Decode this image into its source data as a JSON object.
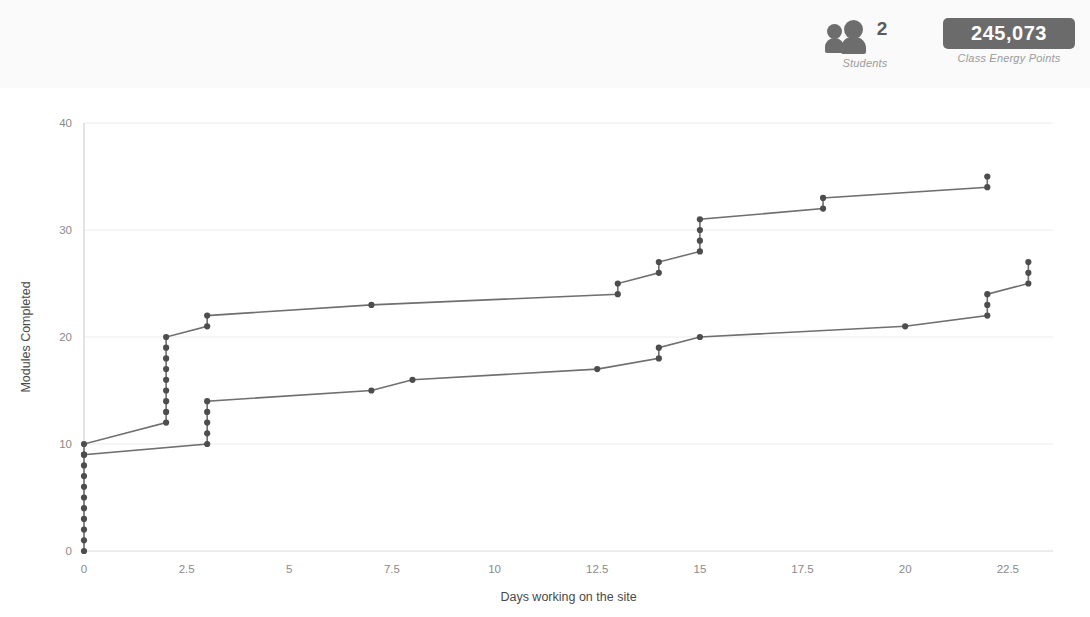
{
  "header": {
    "students": {
      "icon": "people-icon",
      "count": "2",
      "label": "Students"
    },
    "energy": {
      "value": "245,073",
      "label": "Class Energy Points"
    }
  },
  "chart_data": {
    "type": "line",
    "title": "",
    "xlabel": "Days working on the site",
    "ylabel": "Modules Completed",
    "xlim": [
      0,
      23.6
    ],
    "ylim": [
      0,
      40
    ],
    "xticks": [
      "0",
      "2.5",
      "5",
      "7.5",
      "10",
      "12.5",
      "15",
      "17.5",
      "20",
      "22.5"
    ],
    "xtick_values": [
      0,
      2.5,
      5,
      7.5,
      10,
      12.5,
      15,
      17.5,
      20,
      22.5
    ],
    "yticks": [
      "0",
      "10",
      "20",
      "30",
      "40"
    ],
    "ytick_values": [
      0,
      10,
      20,
      30,
      40
    ],
    "grid": true,
    "legend": "none",
    "marker": "circle",
    "line_color": "#6f6f6f",
    "marker_color": "#4d4d4d",
    "grid_color": "#ececec",
    "series": [
      {
        "name": "Student A",
        "points": [
          [
            0,
            9
          ],
          [
            0,
            10
          ],
          [
            2,
            12
          ],
          [
            2,
            13
          ],
          [
            2,
            14
          ],
          [
            2,
            15
          ],
          [
            2,
            16
          ],
          [
            2,
            17
          ],
          [
            2,
            18
          ],
          [
            2,
            19
          ],
          [
            2,
            20
          ],
          [
            3,
            21
          ],
          [
            3,
            22
          ],
          [
            7,
            23
          ],
          [
            13,
            24
          ],
          [
            13,
            25
          ],
          [
            14,
            26
          ],
          [
            14,
            27
          ],
          [
            15,
            28
          ],
          [
            15,
            29
          ],
          [
            15,
            30
          ],
          [
            15,
            31
          ],
          [
            18,
            32
          ],
          [
            18,
            33
          ],
          [
            22,
            34
          ],
          [
            22,
            35
          ]
        ]
      },
      {
        "name": "Student B",
        "points": [
          [
            0,
            0
          ],
          [
            0,
            1
          ],
          [
            0,
            2
          ],
          [
            0,
            3
          ],
          [
            0,
            4
          ],
          [
            0,
            5
          ],
          [
            0,
            6
          ],
          [
            0,
            7
          ],
          [
            0,
            8
          ],
          [
            0,
            9
          ],
          [
            3,
            10
          ],
          [
            3,
            11
          ],
          [
            3,
            12
          ],
          [
            3,
            13
          ],
          [
            3,
            14
          ],
          [
            7,
            15
          ],
          [
            8,
            16
          ],
          [
            12.5,
            17
          ],
          [
            14,
            18
          ],
          [
            14,
            19
          ],
          [
            15,
            20
          ],
          [
            20,
            21
          ],
          [
            22,
            22
          ],
          [
            22,
            23
          ],
          [
            22,
            24
          ],
          [
            23,
            25
          ],
          [
            23,
            26
          ],
          [
            23,
            27
          ]
        ]
      }
    ]
  }
}
